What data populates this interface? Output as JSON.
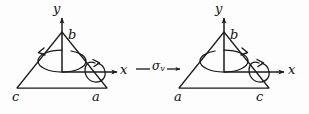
{
  "figure": {
    "width": 309,
    "height": 114,
    "background": "#fdfdfd",
    "stroke_color": "#1a1a1a",
    "text_color": "#111111"
  },
  "operation": {
    "symbol": "σ",
    "subscript": "v",
    "name": "sigma-v-mirror-plane",
    "left_dash": "—",
    "arrow": "→"
  },
  "left_diagram": {
    "name": "before-reflection",
    "axes": {
      "y_label": "y",
      "x_label": "x"
    },
    "vertices": {
      "apex": "b",
      "bottom_left": "c",
      "bottom_right": "a"
    },
    "rotation_arrows": {
      "y_axis_loop": "counterclockwise-ellipse",
      "x_axis_loop": "clockwise-circle"
    }
  },
  "right_diagram": {
    "name": "after-reflection",
    "axes": {
      "y_label": "y",
      "x_label": "x"
    },
    "vertices": {
      "apex": "b",
      "bottom_left": "a",
      "bottom_right": "c"
    },
    "rotation_arrows": {
      "y_axis_loop": "clockwise-ellipse",
      "x_axis_loop": "counterclockwise-circle"
    }
  }
}
